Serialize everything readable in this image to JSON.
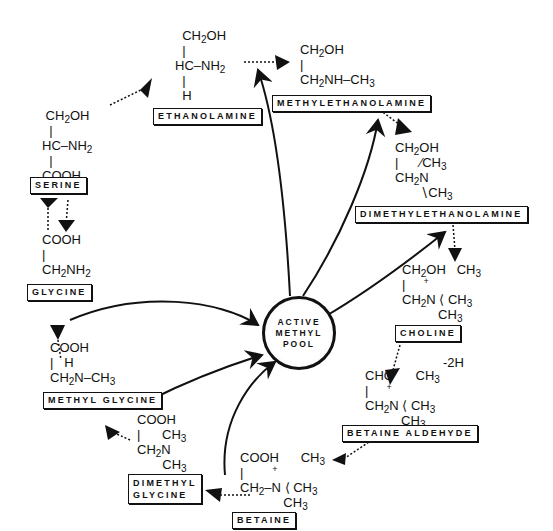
{
  "center": {
    "lines": [
      "ACTIVE",
      "METHYL",
      "POOL"
    ]
  },
  "compounds": {
    "ethanolamine": {
      "label": "ETHANOLAMINE"
    },
    "methylethanolamine": {
      "label": "METHYLETHANOLAMINE"
    },
    "dimethylethanolamine": {
      "label": "DIMETHYLETHANOLAMINE"
    },
    "choline": {
      "label": "CHOLINE"
    },
    "betaine_aldehyde": {
      "label": "BETAINE ALDEHYDE"
    },
    "betaine": {
      "label": "BETAINE"
    },
    "dimethyl_glycine": {
      "label_line1": "DIMETHYL",
      "label_line2": "GLYCINE"
    },
    "methyl_glycine": {
      "label": "METHYL GLYCINE"
    },
    "glycine": {
      "label": "GLYCINE"
    },
    "serine": {
      "label": "SERINE"
    }
  },
  "annotations": {
    "choline_to_aldehyde": "-2H"
  }
}
